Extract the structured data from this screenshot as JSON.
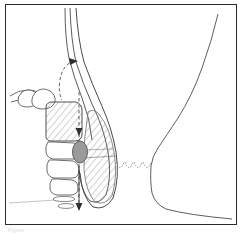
{
  "figure": {
    "caption_remnant": "Figure",
    "frame": {
      "border_color": "#2b2b2b",
      "background_color": "#ffffff",
      "width": 232,
      "height": 221
    },
    "palette": {
      "outline": "#3c3c3c",
      "outline_light": "#6e6e6e",
      "hatch": "#7a7a7a",
      "mass_fill": "#9a9a9a",
      "mass_stroke": "#555555",
      "dashed": "#4a4a4a",
      "scallop": "#8c8c8c",
      "baseline": "#b9b9b9"
    },
    "elements": [
      {
        "name": "descending-tube",
        "label": "Descending tube lumen (three parallel walls)",
        "kind": "outline",
        "line_count": 3,
        "interactable": false
      },
      {
        "name": "rectal-pouch",
        "label": "Rounded blind pouch at distal end",
        "kind": "outline",
        "interactable": false
      },
      {
        "name": "hatched-lumen-region",
        "label": "Hatched elongated lumen region",
        "kind": "hatched",
        "hatch_direction": "upper-left to lower-right",
        "interactable": false
      },
      {
        "name": "bowel-loop-chain",
        "label": "Chain of rounded bowel loop segments",
        "kind": "outline",
        "segment_count": 5,
        "interactable": false
      },
      {
        "name": "hatched-bowel-segment",
        "label": "Hatched bowel segment (distended loop)",
        "kind": "hatched",
        "hatch_direction": "upper-left to lower-right",
        "interactable": false
      },
      {
        "name": "gray-mass-oval",
        "label": "Shaded oval mass",
        "kind": "filled-oval",
        "fill": "#9a9a9a",
        "interactable": false
      },
      {
        "name": "vertical-dashed-axis",
        "label": "Dashed vertical axis with arrowheads",
        "kind": "dashed-line",
        "arrowheads": 2,
        "interactable": false
      },
      {
        "name": "dashed-arc-upper",
        "label": "Dashed arc with leftward arrowhead",
        "kind": "dashed-arc",
        "arrowheads": 1,
        "interactable": false
      },
      {
        "name": "scallop-marks",
        "label": "Scalloped dotted marks",
        "kind": "scallops",
        "count": 4,
        "interactable": false
      },
      {
        "name": "small-ellipse-pair",
        "label": "Pair of small horizontal ellipses",
        "kind": "outline",
        "count": 2,
        "interactable": false
      },
      {
        "name": "body-contour-right",
        "label": "Body surface contour (buttock and thigh profile)",
        "kind": "outline",
        "interactable": false
      },
      {
        "name": "baseline-left",
        "label": "Faint horizontal baseline",
        "kind": "line",
        "interactable": false
      }
    ]
  }
}
